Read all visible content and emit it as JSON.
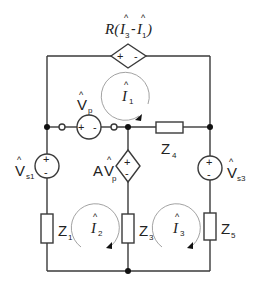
{
  "diagram": {
    "type": "electrical-circuit",
    "top_source": {
      "label": "R(Î3-Î1)",
      "prefix": "R(",
      "i_a": "I",
      "i_a_sub": "3",
      "dash": "-",
      "i_b": "I",
      "i_b_sub": "1",
      "suffix": ")",
      "plus": "+",
      "minus": "-"
    },
    "vp_source": {
      "label": "V̂p",
      "main": "V",
      "sub": "p",
      "plus": "+",
      "minus": "-"
    },
    "vs1_source": {
      "label": "V̂s1",
      "main": "V",
      "sub": "s1",
      "plus": "+",
      "minus": "-"
    },
    "dep_source": {
      "label": "AV̂p",
      "prefix": "A",
      "main": "V",
      "sub": "p",
      "plus": "+",
      "minus": "-"
    },
    "vs3_source": {
      "label": "V̂s3",
      "main": "V",
      "sub": "s3",
      "plus": "+",
      "minus": "-"
    },
    "impedances": [
      {
        "id": "z1",
        "main": "Z",
        "sub": "1"
      },
      {
        "id": "z3",
        "main": "Z",
        "sub": "3"
      },
      {
        "id": "z4",
        "main": "Z",
        "sub": "4"
      },
      {
        "id": "z5",
        "main": "Z",
        "sub": "5"
      }
    ],
    "loop_currents": [
      {
        "id": "i1",
        "main": "I",
        "sub": "1",
        "direction": "clockwise"
      },
      {
        "id": "i2",
        "main": "I",
        "sub": "2",
        "direction": "clockwise"
      },
      {
        "id": "i3",
        "main": "I",
        "sub": "3",
        "direction": "clockwise"
      }
    ],
    "hat": "^"
  }
}
